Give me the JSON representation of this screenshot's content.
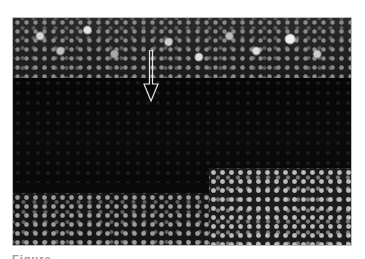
{
  "figure": {
    "type": "micrograph",
    "colors": {
      "background": "#ffffff",
      "image_dark": "#0a0a0a",
      "cells_bright": "#d9d9d9",
      "arrow_outline": "#e6e6e6"
    },
    "annotations": [
      {
        "kind": "arrow",
        "direction": "down",
        "icon": "arrow-down-icon"
      }
    ],
    "caption": "Figure"
  }
}
